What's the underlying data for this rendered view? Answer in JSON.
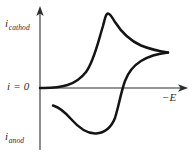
{
  "figure": {
    "kind": "cyclic-voltammogram",
    "background_color": "#ffffff",
    "curve_color": "#141414",
    "axis_color": "#6f7274",
    "text_color": "#2a2c2e",
    "width": 195,
    "height": 152
  },
  "axes": {
    "y_axis": {
      "label_symbol": "i",
      "label_subscript_top": "cathod",
      "label_subscript_bottom": "anod",
      "origin_label": "i = 0",
      "origin_label_symbol": "i",
      "origin_label_rest": " = 0",
      "arrow_direction": "up",
      "x_position_px": 40,
      "top_px": 8,
      "bottom_px": 150
    },
    "x_axis": {
      "label": "−E",
      "arrow_direction": "right",
      "y_position_px": 88,
      "left_px": 40,
      "right_px": 187
    }
  },
  "chart_data": {
    "type": "line",
    "title": "",
    "xlabel": "−E",
    "ylabel": "i",
    "grid": false,
    "legend": null,
    "annotations": [
      {
        "text": "i_cathod",
        "position": "top-left",
        "meaning": "cathodic current direction (positive i axis)"
      },
      {
        "text": "i = 0",
        "position": "left-origin",
        "meaning": "zero current baseline"
      },
      {
        "text": "i_anod",
        "position": "bottom-left",
        "meaning": "anodic current direction (negative i axis)"
      },
      {
        "text": "−E",
        "position": "right",
        "meaning": "increasing negative potential (scan direction)"
      }
    ],
    "axis_ranges": {
      "xlim": [
        0,
        1
      ],
      "ylim": [
        -1,
        1
      ]
    },
    "series": [
      {
        "name": "forward-cathodic-scan",
        "description": "Current rises from baseline to cathodic peak, then decays toward the switching potential.",
        "path_d": "M 40 88 C 62 88.5 76 85 86 72 C 94 61 98 42 103 26 C 105 18 106 13.5 108 13.5 C 110 13.5 112 17 115 22 C 122 33 131 41 141 45.5 C 152 50 161 51.5 168 52.5"
      },
      {
        "name": "reverse-anodic-scan",
        "description": "Return sweep from the switching potential dips below zero current through the anodic peak and tails back toward the left.",
        "path_d": "M 168 52.5 C 159 53.5 149 56 141 61 C 133 66 128 73 125 81 C 121 92 119 105 115 118 C 111 128 104 133 96 133.5 C 86 134 78 127 71 119 C 64 111 58 107 53 105.5"
      }
    ],
    "key_points": [
      {
        "name": "origin",
        "x_px": 40,
        "y_px": 88,
        "meaning": "i = 0 start of scan"
      },
      {
        "name": "cathodic-peak",
        "x_px": 108,
        "y_px": 13.5,
        "meaning": "peak cathodic current i_pc"
      },
      {
        "name": "switching-point",
        "x_px": 168,
        "y_px": 52.5,
        "meaning": "scan reversal potential"
      },
      {
        "name": "zero-crossing-reverse",
        "x_px": 120,
        "y_px": 88,
        "meaning": "reverse branch crosses i = 0"
      },
      {
        "name": "anodic-peak",
        "x_px": 95,
        "y_px": 133.5,
        "meaning": "peak anodic current i_pa"
      },
      {
        "name": "reverse-tail-end",
        "x_px": 53,
        "y_px": 105.5,
        "meaning": "end of reverse sweep"
      }
    ]
  }
}
